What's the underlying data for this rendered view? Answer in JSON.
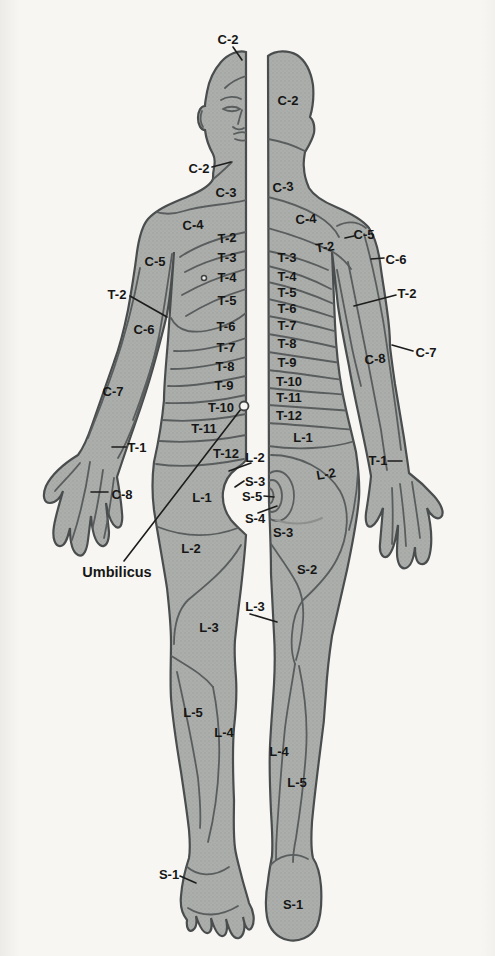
{
  "diagram": {
    "kind": "dermatome body map, split anterior (left) and posterior (right) half-figures",
    "annotation_label": "Umbilicus"
  },
  "colors": {
    "background": "#f7f6f3",
    "body_fill": "#aaada9",
    "body_stipple": "#9b9e9a",
    "outline": "#4a4d4e",
    "boundary_line": "#5a5d5e",
    "fold_line": "#8d908d",
    "leader_line": "#1c1c1c",
    "label_text": "#161616",
    "marker_fill": "#f6f5f2"
  },
  "markers": {
    "umbilicus": {
      "x": 244,
      "y": 406,
      "r": 4.5
    },
    "nipple": {
      "x": 204,
      "y": 278,
      "r": 2.5
    }
  },
  "labels": {
    "anterior": [
      {
        "id": "c2-scalp",
        "text": "C-2",
        "x": 228,
        "y": 39
      },
      {
        "id": "c2-chin",
        "text": "C-2",
        "x": 199,
        "y": 168
      },
      {
        "id": "c3-neck",
        "text": "C-3",
        "x": 226,
        "y": 192
      },
      {
        "id": "c4-shoulder",
        "text": "C-4",
        "x": 193,
        "y": 225,
        "rot": -4
      },
      {
        "id": "t2-sternal",
        "text": "T-2",
        "x": 227,
        "y": 238,
        "rot": -4
      },
      {
        "id": "t3-chest",
        "text": "T-3",
        "x": 227,
        "y": 257
      },
      {
        "id": "c5-shoulder",
        "text": "C-5",
        "x": 155,
        "y": 261
      },
      {
        "id": "t4-chest",
        "text": "T-4",
        "x": 227,
        "y": 277
      },
      {
        "id": "t5-chest",
        "text": "T-5",
        "x": 227,
        "y": 300
      },
      {
        "id": "t2-axilla",
        "text": "T-2",
        "x": 117,
        "y": 294
      },
      {
        "id": "t6-trunk",
        "text": "T-6",
        "x": 226,
        "y": 326
      },
      {
        "id": "c6-forearm",
        "text": "C-6",
        "x": 144,
        "y": 329
      },
      {
        "id": "t7-trunk",
        "text": "T-7",
        "x": 226,
        "y": 347
      },
      {
        "id": "t8-trunk",
        "text": "T-8",
        "x": 225,
        "y": 366
      },
      {
        "id": "t9-trunk",
        "text": "T-9",
        "x": 224,
        "y": 385
      },
      {
        "id": "c7-forearm",
        "text": "C-7",
        "x": 113,
        "y": 391
      },
      {
        "id": "t10-trunk",
        "text": "T-10",
        "x": 221,
        "y": 407
      },
      {
        "id": "t11-trunk",
        "text": "T-11",
        "x": 204,
        "y": 428
      },
      {
        "id": "t1-wrist",
        "text": "T-1",
        "x": 137,
        "y": 447
      },
      {
        "id": "t12-trunk",
        "text": "T-12",
        "x": 226,
        "y": 453
      },
      {
        "id": "l2-groin",
        "text": "L-2",
        "x": 255,
        "y": 457
      },
      {
        "id": "s3-perineum",
        "text": "S-3",
        "x": 255,
        "y": 481
      },
      {
        "id": "c8-hand",
        "text": "C-8",
        "x": 122,
        "y": 494
      },
      {
        "id": "s5-perineum",
        "text": "S-5",
        "x": 252,
        "y": 496
      },
      {
        "id": "l1-thigh",
        "text": "L-1",
        "x": 202,
        "y": 497
      },
      {
        "id": "s4-perineum",
        "text": "S-4",
        "x": 255,
        "y": 518
      },
      {
        "id": "l2-thigh",
        "text": "L-2",
        "x": 191,
        "y": 548
      },
      {
        "id": "umbilicus",
        "text": "Umbilicus",
        "x": 117,
        "y": 572,
        "big": true
      },
      {
        "id": "l3-gap",
        "text": "L-3",
        "x": 255,
        "y": 606
      },
      {
        "id": "l3-thigh",
        "text": "L-3",
        "x": 209,
        "y": 627
      },
      {
        "id": "l5-leg",
        "text": "L-5",
        "x": 193,
        "y": 712
      },
      {
        "id": "l4-leg",
        "text": "L-4",
        "x": 224,
        "y": 732
      },
      {
        "id": "s1-foot",
        "text": "S-1",
        "x": 169,
        "y": 874
      }
    ],
    "posterior": [
      {
        "id": "c2-occiput",
        "text": "C-2",
        "x": 288,
        "y": 100
      },
      {
        "id": "c3-neck",
        "text": "C-3",
        "x": 283,
        "y": 187,
        "rot": -6
      },
      {
        "id": "c4-shoulder",
        "text": "C-4",
        "x": 306,
        "y": 219,
        "rot": -4
      },
      {
        "id": "c5-shoulder",
        "text": "C-5",
        "x": 364,
        "y": 234
      },
      {
        "id": "t2-scapula",
        "text": "T-2",
        "x": 325,
        "y": 247,
        "rot": -8
      },
      {
        "id": "t3-back",
        "text": "T-3",
        "x": 287,
        "y": 257
      },
      {
        "id": "c6-arm",
        "text": "C-6",
        "x": 396,
        "y": 259
      },
      {
        "id": "t4-back",
        "text": "T-4",
        "x": 287,
        "y": 276
      },
      {
        "id": "t5-back",
        "text": "T-5",
        "x": 287,
        "y": 292
      },
      {
        "id": "t2-arm",
        "text": "T-2",
        "x": 407,
        "y": 293
      },
      {
        "id": "t6-back",
        "text": "T-6",
        "x": 287,
        "y": 308
      },
      {
        "id": "t7-back",
        "text": "T-7",
        "x": 287,
        "y": 325
      },
      {
        "id": "t8-back",
        "text": "T-8",
        "x": 287,
        "y": 343
      },
      {
        "id": "c7-arm",
        "text": "C-7",
        "x": 426,
        "y": 352
      },
      {
        "id": "c8-forearm",
        "text": "C-8",
        "x": 375,
        "y": 359,
        "rot": -6
      },
      {
        "id": "t9-back",
        "text": "T-9",
        "x": 287,
        "y": 362
      },
      {
        "id": "t10-back",
        "text": "T-10",
        "x": 289,
        "y": 381
      },
      {
        "id": "t11-back",
        "text": "T-11",
        "x": 289,
        "y": 397
      },
      {
        "id": "t12-back",
        "text": "T-12",
        "x": 289,
        "y": 415
      },
      {
        "id": "l1-back",
        "text": "L-1",
        "x": 303,
        "y": 437
      },
      {
        "id": "t1-wrist",
        "text": "T-1",
        "x": 378,
        "y": 460
      },
      {
        "id": "l2-buttock",
        "text": "L-2",
        "x": 326,
        "y": 474,
        "rot": -10
      },
      {
        "id": "s3-buttock",
        "text": "S-3",
        "x": 283,
        "y": 532
      },
      {
        "id": "s2-thigh",
        "text": "S-2",
        "x": 307,
        "y": 569
      },
      {
        "id": "l4-calf",
        "text": "L-4",
        "x": 279,
        "y": 751
      },
      {
        "id": "l5-calf",
        "text": "L-5",
        "x": 297,
        "y": 782
      },
      {
        "id": "s1-heel",
        "text": "S-1",
        "x": 293,
        "y": 904
      }
    ]
  }
}
